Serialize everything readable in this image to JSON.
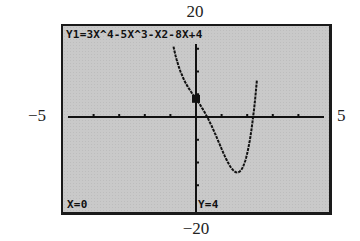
{
  "window": {
    "xmin": "−5",
    "xmax": "5",
    "ymin": "−20",
    "ymax": "20",
    "xscl": 1,
    "yscl": 5
  },
  "screen": {
    "equation": "Y1=3X^4-5X^3-X2-8X+4",
    "trace_x": "X=0",
    "trace_y": "Y=4"
  },
  "chart_data": {
    "type": "line",
    "title": "Y1=3X^4-5X^3-X2-8X+4",
    "xlabel": "",
    "ylabel": "",
    "xlim": [
      -5,
      5
    ],
    "ylim": [
      -20,
      20
    ],
    "grid": false,
    "series": [
      {
        "name": "Y1",
        "x": [
          -0.8,
          -0.6,
          -0.4,
          -0.2,
          0,
          0.2,
          0.4,
          0.6,
          0.8,
          1.0,
          1.2,
          1.4,
          1.6,
          1.8,
          2.0,
          2.2
        ],
        "values": [
          18.6,
          11.5,
          7.6,
          5.6,
          4.0,
          2.3,
          0.4,
          -1.8,
          -4.4,
          -7.0,
          -9.6,
          -11.7,
          -12.5,
          -11.0,
          -4.0,
          11.2
        ]
      }
    ],
    "trace_point": {
      "x": 0,
      "y": 4
    },
    "annotations": [
      "X=0",
      "Y=4"
    ]
  }
}
